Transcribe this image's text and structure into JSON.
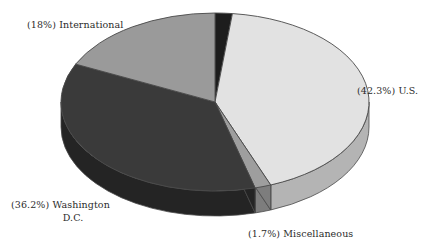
{
  "chart_data": {
    "type": "pie",
    "title": "",
    "subtitle": "",
    "xlabel": "",
    "ylabel": "",
    "legend_position": "none",
    "grid": false,
    "three_d": true,
    "start_angle_deg": 0,
    "direction": "clockwise",
    "categories": [
      "U.S.",
      "Miscellaneous",
      "Washington D.C.",
      "International",
      "Unlabeled"
    ],
    "values": [
      42.3,
      1.7,
      36.2,
      18.0,
      1.8
    ],
    "units": "percent",
    "slices": [
      {
        "name": "unlabeled-sliver",
        "label": "",
        "value": 1.8,
        "percent_text": "",
        "color": "#1d1d1d",
        "side_color": "#101010",
        "start_deg": 0,
        "end_deg": 6.5,
        "has_label": false
      },
      {
        "name": "us",
        "label": "U.S.",
        "value": 42.3,
        "percent_text": "(42.3%) U.S.",
        "color": "#e2e2e2",
        "side_color": "#b4b4b4",
        "start_deg": 6.5,
        "end_deg": 158.8,
        "has_label": true
      },
      {
        "name": "miscellaneous",
        "label": "Miscellaneous",
        "value": 1.7,
        "percent_text": "(1.7%) Miscellaneous",
        "color": "#9e9e9e",
        "side_color": "#7d7d7d",
        "start_deg": 158.8,
        "end_deg": 164.9,
        "has_label": true
      },
      {
        "name": "washington-dc",
        "label": "Washington D.C.",
        "value": 36.2,
        "percent_text_line1": "(36.2%) Washington",
        "percent_text_line2": "D.C.",
        "color": "#3a3a3a",
        "side_color": "#242424",
        "start_deg": 164.9,
        "end_deg": 295.2,
        "has_label": true
      },
      {
        "name": "international",
        "label": "International",
        "value": 18.0,
        "percent_text": "(18%) International",
        "color": "#9a9a9a",
        "side_color": "#787878",
        "start_deg": 295.2,
        "end_deg": 360,
        "has_label": true
      }
    ]
  },
  "labels": {
    "international": "(18%) International",
    "us": "(42.3%) U.S.",
    "washington_line1": "(36.2%) Washington",
    "washington_line2": "D.C.",
    "miscellaneous": "(1.7%) Miscellaneous"
  },
  "colors": {
    "background": "#ffffff",
    "text": "#2b2b2b",
    "outline": "#4a4a4a",
    "us_top": "#e2e2e2",
    "us_side": "#b4b4b4",
    "misc_top": "#9e9e9e",
    "misc_side": "#7d7d7d",
    "dc_top": "#3a3a3a",
    "dc_side": "#242424",
    "intl_top": "#9a9a9a",
    "intl_side": "#787878",
    "sliver_top": "#1d1d1d",
    "sliver_side": "#101010"
  },
  "geometry": {
    "center_x": 215,
    "center_y": 102,
    "radius_x": 154,
    "radius_y": 89,
    "depth": 25
  }
}
